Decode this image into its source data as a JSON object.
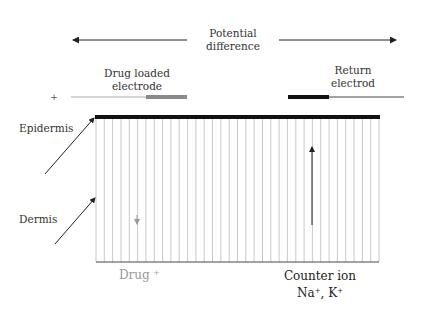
{
  "diagram": {
    "potential_difference": {
      "line1": "Potential",
      "line2": "difference"
    },
    "drug_electrode": {
      "line1": "Drug loaded",
      "line2": "electrode",
      "polarity": "+"
    },
    "return_electrode": {
      "line1": "Return",
      "line2": "electrod"
    },
    "layers": {
      "epidermis": "Epidermis",
      "dermis": "Dermis"
    },
    "drug_label": "Drug",
    "drug_charge": "+",
    "counter_ion": {
      "line1": "Counter ion",
      "line2_na": "Na",
      "line2_sep": ", K",
      "charge": "+"
    },
    "colors": {
      "epidermis_bar": "#111111",
      "tissue_lines": "#bbbbbb",
      "drug_electrode_pad": "#8a8a8a",
      "return_electrode_pad": "#111111",
      "drug_text": "#9a9a9a"
    },
    "geometry": {
      "box_left": 96,
      "box_right": 379,
      "box_top": 117,
      "box_bottom": 262,
      "line_count": 34
    }
  }
}
